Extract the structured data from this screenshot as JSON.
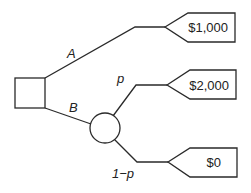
{
  "diagram": {
    "type": "decision-tree",
    "decision_node": {
      "shape": "square"
    },
    "chance_node": {
      "shape": "circle"
    },
    "branches": {
      "a": {
        "label": "A",
        "payoff": "$1,000"
      },
      "b": {
        "label": "B"
      },
      "p": {
        "label": "p",
        "payoff": "$2,000"
      },
      "one_minus_p": {
        "label": "1−p",
        "payoff": "$0"
      }
    }
  }
}
